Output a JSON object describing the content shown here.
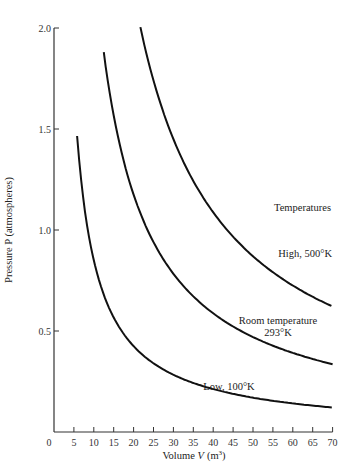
{
  "chart_data": {
    "type": "line",
    "title": "",
    "xlabel": "Volume V (m³)",
    "ylabel": "Pressure P (atmospheres)",
    "xlim": [
      0,
      70
    ],
    "ylim": [
      0,
      2.0
    ],
    "x_ticks": [
      0,
      5,
      10,
      15,
      20,
      25,
      30,
      35,
      40,
      45,
      50,
      55,
      60,
      65,
      70
    ],
    "y_ticks": [
      0.5,
      1.0,
      1.5,
      2.0
    ],
    "grid": false,
    "legend_title": "Temperatures",
    "series": [
      {
        "name": "High, 500°K",
        "k": 43.5,
        "x_start": 21.7,
        "x_end": 70,
        "start_point": [
          21.7,
          2.0
        ],
        "end_point": [
          70,
          0.63
        ]
      },
      {
        "name": "Room temperature 293°K",
        "k": 23.5,
        "x_start": 12.5,
        "x_end": 70,
        "start_point": [
          12.5,
          1.84
        ],
        "end_point": [
          70,
          0.34
        ]
      },
      {
        "name": "Low, 100°K",
        "k": 8.5,
        "x_start": 5.8,
        "x_end": 70,
        "start_point": [
          5.8,
          1.46
        ],
        "end_point": [
          70,
          0.13
        ]
      }
    ],
    "annotations": [
      {
        "text": "Temperatures",
        "x": 57,
        "y": 1.08
      },
      {
        "text": "High, 500°K",
        "x": 57,
        "y": 0.85
      },
      {
        "text": "Room temperature",
        "x": 53,
        "y": 0.46
      },
      {
        "text": "293°K",
        "x": 53,
        "y": 0.4
      },
      {
        "text": "Low, 100°K",
        "x": 42,
        "y": 0.25
      }
    ]
  },
  "labels": {
    "legend_title": "Temperatures",
    "high": "High, 500°K",
    "room_line1": "Room temperature",
    "room_line2": "293°K",
    "low": "Low, 100°K",
    "xlabel_prefix": "Volume ",
    "xlabel_var": "V",
    "xlabel_unit": "(m",
    "xlabel_sup": "3",
    "xlabel_close": ")",
    "ylabel": "Pressure P (atmospheres)"
  }
}
